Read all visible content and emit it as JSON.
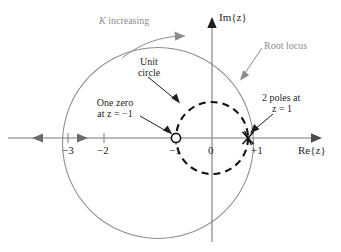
{
  "figure": {
    "type": "root-locus-diagram",
    "background": "#ffffff",
    "colors": {
      "root_locus": "#8d8d8d",
      "unit_circle": "#000000",
      "axis": "#7a7a7a",
      "text": "#1f1f1f",
      "gray_text": "#8d8d8d"
    },
    "axes": {
      "real_axis_label": "Re{z}",
      "imag_axis_label": "Im{z}",
      "origin_label": "0",
      "ticks": [
        {
          "label": "−3",
          "value": -3
        },
        {
          "label": "−2",
          "value": -2
        },
        {
          "label": "−1",
          "value": -1
        },
        {
          "label": "0",
          "value": 0
        },
        {
          "label": "+1",
          "value": 1
        }
      ]
    },
    "annotations": {
      "k_increasing": "K increasing",
      "root_locus": "Root locus",
      "unit_circle_line1": "Unit",
      "unit_circle_line2": "circle",
      "one_zero_line1": "One zero",
      "one_zero_line2": "at z = −1",
      "two_poles_line1": "2 poles at",
      "two_poles_line2": "z = 1"
    },
    "markers": {
      "zero": {
        "symbol": "o",
        "at": -1,
        "name": "zero-marker"
      },
      "poles": {
        "symbol": "x",
        "at": 1,
        "count": 2,
        "name": "pole-marker"
      }
    },
    "curves": {
      "root_locus_circle": {
        "center_re": -1.5,
        "center_im": 0,
        "radius": 2.64,
        "style": "solid"
      },
      "unit_circle": {
        "center_re": 0,
        "center_im": 0,
        "radius": 1,
        "style": "dashed"
      }
    }
  }
}
